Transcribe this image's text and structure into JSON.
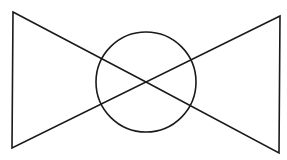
{
  "diagram": {
    "type": "valve-symbol",
    "background": "#ffffff",
    "stroke_color": "#1a1a1a",
    "stroke_width": 1.6,
    "left_triangle": {
      "points": [
        [
          13,
          12
        ],
        [
          146,
          82
        ],
        [
          12,
          148
        ]
      ]
    },
    "right_triangle": {
      "points": [
        [
          280,
          16
        ],
        [
          146,
          82
        ],
        [
          279,
          153
        ]
      ]
    },
    "circle": {
      "cx": 146,
      "cy": 82,
      "r": 50
    }
  }
}
